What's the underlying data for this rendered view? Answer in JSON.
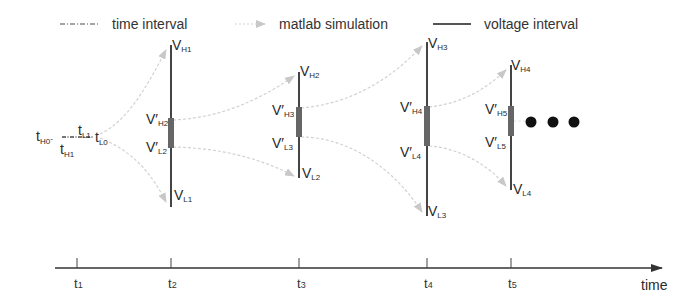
{
  "legend": {
    "items": [
      {
        "label": "time interval",
        "style": "dash-dot",
        "color": "#777777"
      },
      {
        "label": "matlab simulation",
        "style": "arrow",
        "color": "#cccccc"
      },
      {
        "label": "voltage interval",
        "style": "solid",
        "color": "#444444"
      }
    ]
  },
  "left_cluster": {
    "labels": [
      {
        "main": "t",
        "sub": "H0",
        "suffix": "-"
      },
      {
        "main": "t",
        "sub": "H1"
      },
      {
        "main": "t",
        "sub": "L1"
      },
      {
        "main": "t",
        "sub": "L0"
      }
    ]
  },
  "intervals": [
    {
      "top": {
        "main": "V",
        "sub": "H1"
      },
      "bottom": {
        "main": "V",
        "sub": "L1"
      },
      "inner_top": {
        "main": "V′",
        "sub": "H2"
      },
      "inner_bottom": {
        "main": "V′",
        "sub": "L2"
      }
    },
    {
      "top": {
        "main": "V",
        "sub": "H2"
      },
      "bottom": {
        "main": "V",
        "sub": "L2"
      },
      "inner_top": {
        "main": "V′",
        "sub": "H3"
      },
      "inner_bottom": {
        "main": "V′",
        "sub": "L3"
      }
    },
    {
      "top": {
        "main": "V",
        "sub": "H3"
      },
      "bottom": {
        "main": "V",
        "sub": "L3"
      },
      "inner_top": {
        "main": "V′",
        "sub": "H4"
      },
      "inner_bottom": {
        "main": "V′",
        "sub": "L4"
      }
    },
    {
      "top": {
        "main": "V",
        "sub": "H4"
      },
      "bottom": {
        "main": "V",
        "sub": "L4"
      },
      "inner_top": {
        "main": "V′",
        "sub": "H5"
      },
      "inner_bottom": {
        "main": "V′",
        "sub": "L5"
      }
    }
  ],
  "ellipsis": "• • •",
  "axis": {
    "label": "time",
    "ticks": [
      {
        "main": "t",
        "sub": "1"
      },
      {
        "main": "t",
        "sub": "2"
      },
      {
        "main": "t",
        "sub": "3"
      },
      {
        "main": "t",
        "sub": "4"
      },
      {
        "main": "t",
        "sub": "5"
      }
    ]
  },
  "colors": {
    "voltage_line": "#444444",
    "voltage_thick": "#666666",
    "simulation_arrow": "#cccccc",
    "time_interval": "#777777",
    "axis": "#333333"
  }
}
